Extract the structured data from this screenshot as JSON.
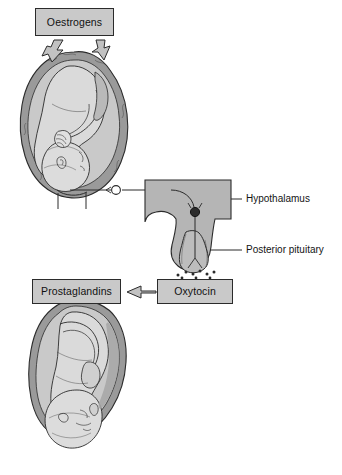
{
  "diagram": {
    "type": "physiology-flow-diagram",
    "background_color": "#ffffff",
    "fill_light": "#d6d6d6",
    "fill_mid": "#c2c2c2",
    "fill_dark": "#9a9a9a",
    "stroke_color": "#2b2b2b",
    "label_box_fill": "#c9c9c9"
  },
  "boxes": {
    "oestrogens": {
      "label": "Oestrogens"
    },
    "oxytocin": {
      "label": "Oxytocin"
    },
    "prostaglandins": {
      "label": "Prostaglandins"
    }
  },
  "leader_labels": {
    "hypothalamus": {
      "label": "Hypothalamus"
    },
    "posterior_pituitary": {
      "label": "Posterior pituitary"
    }
  },
  "illustrations": {
    "upper": {
      "name": "fetus-in-uterus-before-labour"
    },
    "lower": {
      "name": "fetus-descending-during-labour"
    },
    "brain": {
      "name": "hypothalamus-and-posterior-pituitary"
    }
  },
  "arrows": {
    "oestrogens_left": {
      "name": "block-arrow-down-left"
    },
    "oestrogens_right": {
      "name": "block-arrow-down-right"
    },
    "oxytocin_to_prostaglandins": {
      "name": "block-arrow-left"
    }
  },
  "pathway": {
    "afferent_neurons": 2,
    "neurosecretory_cell_bodies": 1,
    "secretion_dots": 9
  }
}
